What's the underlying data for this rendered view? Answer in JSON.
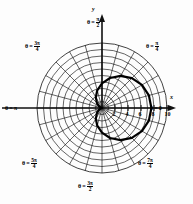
{
  "figure": {
    "background": "#fdfdfd",
    "ink": "#111111"
  },
  "axes": {
    "x_axis_name": "x",
    "y_axis_name": "y",
    "pole": {
      "x": 102,
      "y": 108
    },
    "x_tick_labels": [
      "2",
      "4",
      "6",
      "8",
      "10"
    ],
    "x_tick_values": [
      2,
      4,
      6,
      8,
      10
    ],
    "unit_px": 6.5
  },
  "angle_labels": [
    {
      "name": "theta-0",
      "prefix": "θ =",
      "value": "0",
      "kind": "plain",
      "x": 150,
      "y": 105
    },
    {
      "name": "theta-pi-4",
      "prefix": "θ =",
      "num": "π",
      "den": "4",
      "kind": "frac",
      "x": 146,
      "y": 41
    },
    {
      "name": "theta-pi-2",
      "prefix": "θ =",
      "num": "π",
      "den": "2",
      "kind": "frac",
      "x": 87,
      "y": 17
    },
    {
      "name": "theta-3pi-4",
      "prefix": "θ =",
      "num": "3π",
      "den": "4",
      "kind": "frac",
      "x": 25,
      "y": 41
    },
    {
      "name": "theta-pi",
      "prefix": "θ =",
      "value": "π",
      "kind": "plain",
      "x": 5,
      "y": 105
    },
    {
      "name": "theta-5pi-4",
      "prefix": "θ =",
      "num": "5π",
      "den": "4",
      "kind": "frac",
      "x": 22,
      "y": 158
    },
    {
      "name": "theta-3pi-2",
      "prefix": "θ =",
      "num": "3π",
      "den": "2",
      "kind": "frac",
      "x": 78,
      "y": 181
    },
    {
      "name": "theta-7pi-4",
      "prefix": "θ =",
      "num": "7π",
      "den": "4",
      "kind": "frac",
      "x": 138,
      "y": 158
    }
  ],
  "chart_data": {
    "type": "line",
    "coordinate_system": "polar",
    "title": "",
    "xlabel": "x",
    "ylabel": "y",
    "grid": true,
    "grid_circles_r": [
      1,
      2,
      3,
      4,
      5,
      6,
      7,
      8,
      9,
      10
    ],
    "grid_rays_deg": [
      0,
      15,
      30,
      45,
      60,
      75,
      90,
      105,
      120,
      135,
      150,
      165,
      180,
      195,
      210,
      225,
      240,
      255,
      270,
      285,
      300,
      315,
      330,
      345
    ],
    "rlim": [
      0,
      10
    ],
    "tick_labels": [
      "2",
      "4",
      "6",
      "8",
      "10"
    ],
    "curve": {
      "name": "limacon",
      "equation": "r = a(1 - cosθ)",
      "a": 3.8,
      "closed": true,
      "stroke_width_px": 2.2,
      "theta_deg": [
        0,
        15,
        30,
        45,
        60,
        75,
        90,
        105,
        120,
        135,
        150,
        165,
        180,
        195,
        210,
        225,
        240,
        255,
        270,
        285,
        300,
        315,
        330,
        345,
        360
      ],
      "r": [
        0.0,
        0.13,
        0.51,
        1.11,
        1.9,
        2.82,
        3.8,
        4.78,
        5.7,
        6.49,
        7.09,
        7.47,
        7.6,
        7.47,
        7.09,
        6.49,
        5.7,
        4.78,
        3.8,
        2.82,
        1.9,
        1.11,
        0.51,
        0.13,
        0.0
      ]
    },
    "legend": []
  }
}
